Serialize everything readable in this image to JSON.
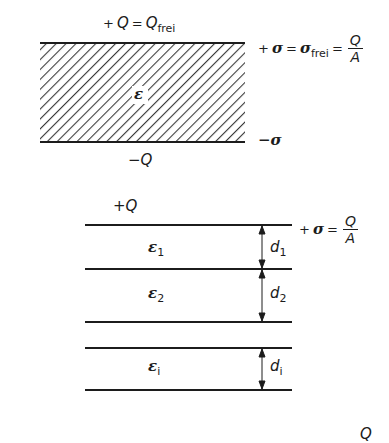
{
  "top_diagram": {
    "top_charge_label": {
      "sign": "+",
      "q": "Q",
      "eq": "=",
      "q2": "Q",
      "sub": "frei"
    },
    "top_sigma_label": {
      "sign": "+",
      "sigma": "σ",
      "eq1": "=",
      "sigma2": "σ",
      "sub": "frei",
      "eq2": "=",
      "num": "Q",
      "den": "A"
    },
    "dielectric_label": "ε",
    "bottom_sigma_label": "−σ",
    "bottom_charge_label": "−Q",
    "hatch_color": "#3a3a3a"
  },
  "bottom_diagram": {
    "top_charge_label": "+Q",
    "top_sigma_label": {
      "sign": "+",
      "sigma": "σ",
      "eq": "=",
      "num": "Q",
      "den": "A"
    },
    "layers": [
      {
        "epsilon": "ε",
        "eps_sub": "1",
        "d": "d",
        "d_sub": "1"
      },
      {
        "epsilon": "ε",
        "eps_sub": "2",
        "d": "d",
        "d_sub": "2"
      },
      {
        "epsilon": "ε",
        "eps_sub": "i",
        "d": "d",
        "d_sub": "i"
      }
    ]
  },
  "footer_fragment": "Q"
}
